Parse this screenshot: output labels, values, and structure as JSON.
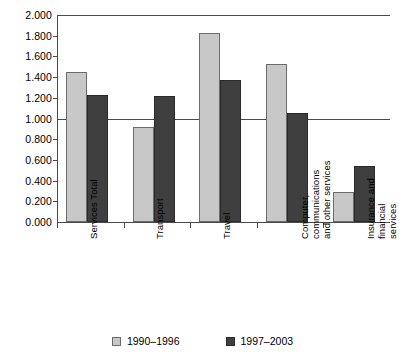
{
  "chart_data": {
    "type": "bar",
    "title": "",
    "subtitle": "",
    "xlabel": "",
    "ylabel": "",
    "ylim": [
      0,
      2.0
    ],
    "ytick_step": 0.2,
    "grid": false,
    "legend_position": "bottom",
    "reference_line": {
      "value": 1.0,
      "label": "1.000"
    },
    "ytick_labels": [
      "2.000",
      "1.800",
      "1.600",
      "1.400",
      "1.200",
      "1.000",
      "0.800",
      "0.600",
      "0.400",
      "0.200",
      "0.000"
    ],
    "ytick_values": [
      2.0,
      1.8,
      1.6,
      1.4,
      1.2,
      1.0,
      0.8,
      0.6,
      0.4,
      0.2,
      0.0
    ],
    "categories": [
      "Services Total",
      "Transport",
      "Travel",
      "Computer, communications and other services",
      "Insurance and financial services"
    ],
    "category_label_lines": [
      [
        "Services Total"
      ],
      [
        "Transport"
      ],
      [
        "Travel"
      ],
      [
        "Computer,",
        "communications",
        "and other services"
      ],
      [
        "Insurance and",
        "financial",
        "services"
      ]
    ],
    "series": [
      {
        "name": "1990–1996",
        "color": "#c8c8c8",
        "values": [
          1.44,
          0.91,
          1.82,
          1.52,
          0.28
        ]
      },
      {
        "name": "1997–2003",
        "color": "#3f3f3f",
        "values": [
          1.22,
          1.21,
          1.36,
          1.04,
          0.53
        ]
      }
    ]
  },
  "legend": {
    "entries": [
      {
        "label": "1990–1996",
        "swatch": "legend-swatch-light"
      },
      {
        "label": "1997–2003",
        "swatch": "legend-swatch-dark"
      }
    ]
  },
  "colors": {
    "series_a": "#c8c8c8",
    "series_b": "#3f3f3f",
    "axis": "#4a4a4a",
    "background": "#ffffff",
    "text": "#000000"
  }
}
